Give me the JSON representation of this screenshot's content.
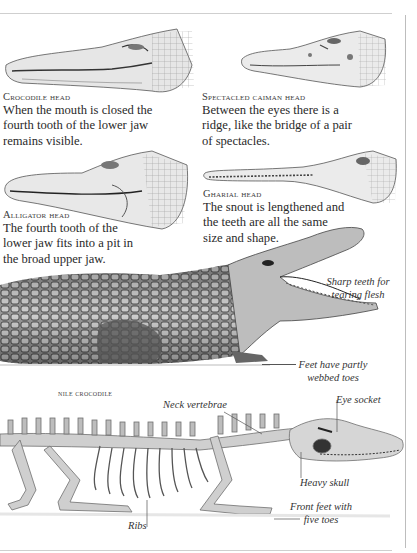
{
  "page": {
    "background": "#ffffff",
    "rule_color": "#cfcfcf"
  },
  "heads": [
    {
      "id": "crocodile",
      "title": "Crocodile head",
      "body": [
        "When the mouth is closed the",
        "fourth tooth of the lower jaw",
        "remains visible."
      ],
      "illustration": "crocodile-head-drawing"
    },
    {
      "id": "spectacled-caiman",
      "title": "Spectacled caiman head",
      "body": [
        "Between the eyes there is a",
        "ridge, like the bridge of a pair",
        "of spectacles."
      ],
      "illustration": "caiman-head-drawing"
    },
    {
      "id": "alligator",
      "title": "Alligator head",
      "body": [
        "The fourth tooth of the",
        "lower jaw fits into a pit in",
        "the broad upper jaw."
      ],
      "illustration": "alligator-head-drawing"
    },
    {
      "id": "gharial",
      "title": "Gharial head",
      "body": [
        "The snout is lengthened and",
        "the teeth are all the same",
        "size and shape."
      ],
      "illustration": "gharial-head-drawing"
    }
  ],
  "nile_crocodile": {
    "caption": "Nile crocodile",
    "labels": {
      "teeth": [
        "Sharp teeth for",
        "tearing flesh"
      ],
      "feet": [
        "Feet have partly",
        "webbed toes"
      ]
    }
  },
  "skeleton": {
    "labels": {
      "neck": "Neck vertebrae",
      "eye": "Eye socket",
      "skull": "Heavy skull",
      "front_feet": [
        "Front feet with",
        "five toes"
      ],
      "ribs": "Ribs"
    }
  }
}
